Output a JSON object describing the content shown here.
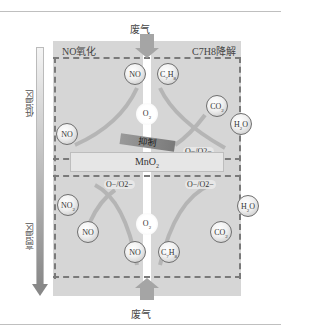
{
  "top_label": "废气",
  "bottom_label": "废气",
  "left_section_title": "NO氧化",
  "right_section_title": "C7H8降解",
  "catalyst": "MnO2",
  "inhibit_label": "抑制",
  "temperature_axis": {
    "low": "低温区",
    "high": "高温区"
  },
  "upper_zone": {
    "molecules": [
      "NO",
      "C7H8",
      "O2",
      "NO",
      "CO2",
      "H2O"
    ],
    "species": "O−/O2−"
  },
  "lower_zone": {
    "species_left": "O−/O2−",
    "species_right": "O−/O2−",
    "molecules": [
      "NO2",
      "NO",
      "O2",
      "NO",
      "C7H8",
      "CO2",
      "H2O"
    ]
  },
  "colors": {
    "panel": "#d6d6d6",
    "dash": "#7a7a7a",
    "arrow": "#a5a5a5"
  }
}
